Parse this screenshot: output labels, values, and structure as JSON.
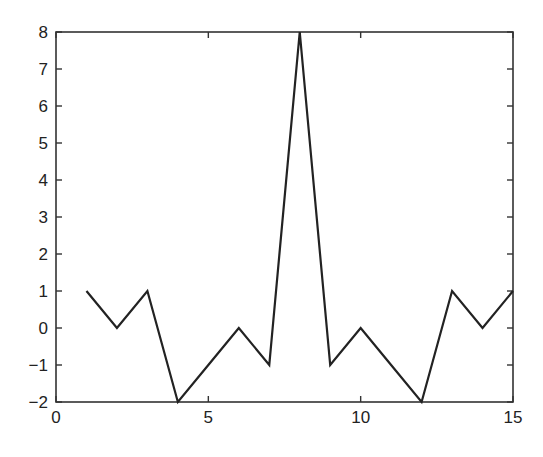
{
  "chart_data": {
    "type": "line",
    "title": "",
    "xlabel": "",
    "ylabel": "",
    "x": [
      1,
      2,
      3,
      4,
      5,
      6,
      7,
      8,
      9,
      10,
      11,
      12,
      13,
      14,
      15
    ],
    "series": [
      {
        "name": "",
        "values": [
          1,
          0,
          1,
          -2,
          -1,
          0,
          -1,
          8,
          -1,
          0,
          -1,
          -2,
          1,
          0,
          1
        ]
      }
    ],
    "xlim": [
      0,
      15
    ],
    "ylim": [
      -2,
      8
    ],
    "xticks": [
      0,
      5,
      10,
      15
    ],
    "yticks": [
      -2,
      -1,
      0,
      1,
      2,
      3,
      4,
      5,
      6,
      7,
      8
    ],
    "xtick_labels": [
      "0",
      "5",
      "10",
      "15"
    ],
    "ytick_labels": [
      "−2",
      "−1",
      "0",
      "1",
      "2",
      "3",
      "4",
      "5",
      "6",
      "7",
      "8"
    ],
    "grid": false,
    "legend": null,
    "line_color": "#222222"
  }
}
